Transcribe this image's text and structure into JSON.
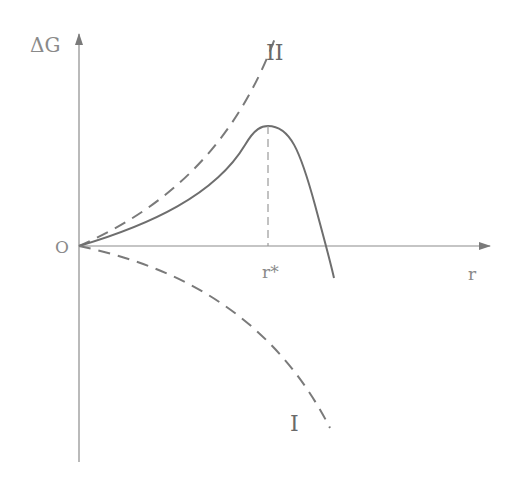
{
  "diagram": {
    "title": "",
    "y_axis_label": "ΔG",
    "x_axis_label": "r",
    "origin_label": "O",
    "critical_radius_label": "r*",
    "curves": [
      {
        "id": "II",
        "label": "II",
        "style": "dashed",
        "description": "rising curve"
      },
      {
        "id": "total",
        "label": "",
        "style": "solid",
        "description": "maximum at r*"
      },
      {
        "id": "I",
        "label": "I",
        "style": "dashed",
        "description": "falling curve"
      }
    ],
    "colors": {
      "axis": "#8c8c8c",
      "curve": "#7a7a7a",
      "dashed_guide": "#9a9a9a",
      "background": "#ffffff"
    }
  }
}
